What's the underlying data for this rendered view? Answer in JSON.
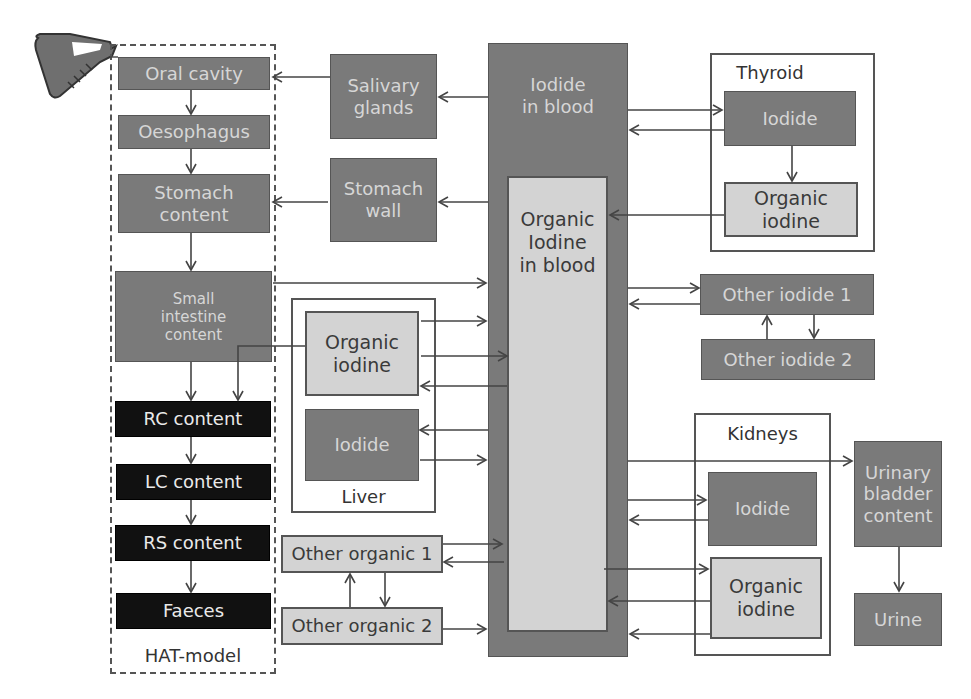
{
  "diagram": {
    "hat_model": {
      "label": "HAT-model",
      "compartments": [
        {
          "id": "oral-cavity",
          "label": "Oral cavity"
        },
        {
          "id": "oesophagus",
          "label": "Oesophagus"
        },
        {
          "id": "stomach-content",
          "label": "Stomach\ncontent"
        },
        {
          "id": "small-intestine-content",
          "label": "Small\nintestine\ncontent"
        },
        {
          "id": "rc-content",
          "label": "RC content"
        },
        {
          "id": "lc-content",
          "label": "LC content"
        },
        {
          "id": "rs-content",
          "label": "RS content"
        },
        {
          "id": "faeces",
          "label": "Faeces"
        }
      ]
    },
    "salivary_glands": "Salivary\nglands",
    "stomach_wall": "Stomach\nwall",
    "iodide_in_blood": "Iodide\nin blood",
    "organic_iodine_in_blood": "Organic\nIodine\nin blood",
    "liver": {
      "label": "Liver",
      "organic_iodine": "Organic\niodine",
      "iodide": "Iodide"
    },
    "other_organic_1": "Other organic 1",
    "other_organic_2": "Other organic 2",
    "thyroid": {
      "label": "Thyroid",
      "iodide": "Iodide",
      "organic_iodine": "Organic\niodine"
    },
    "other_iodide_1": "Other iodide 1",
    "other_iodide_2": "Other iodide 2",
    "kidneys": {
      "label": "Kidneys",
      "iodide": "Iodide",
      "organic_iodine": "Organic\niodine"
    },
    "urinary_bladder_content": "Urinary\nbladder\ncontent",
    "urine": "Urine",
    "icons": {
      "intake": "beaker-icon"
    },
    "colors": {
      "dark_compartment": "#7a7a7a",
      "light_compartment": "#d3d3d3",
      "black_compartment": "#111111",
      "line": "#444444"
    }
  }
}
